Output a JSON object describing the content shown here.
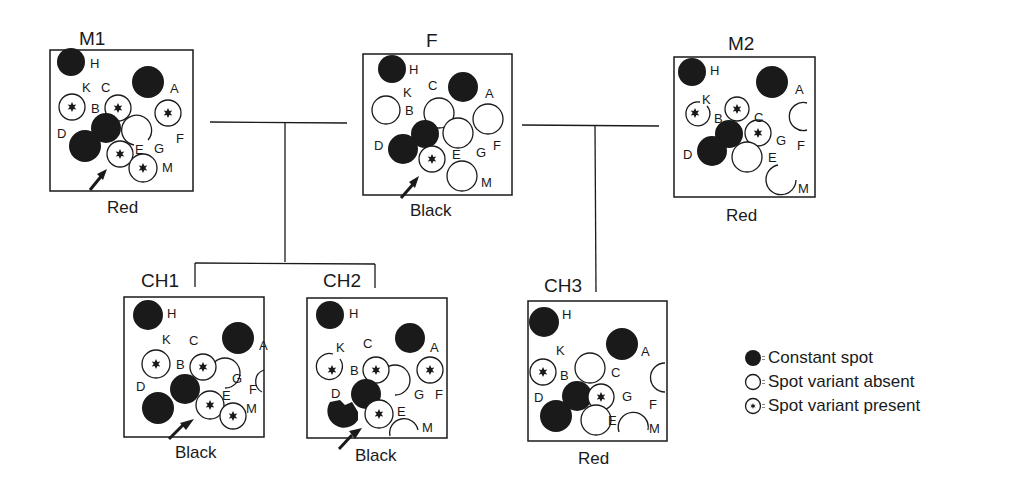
{
  "individuals": [
    {
      "id": "M1",
      "title": "M1",
      "phenotype": "Red",
      "arrow": true,
      "spots": {
        "H": "constant",
        "A": "constant",
        "D": "constant",
        "B": "constant",
        "K": "present",
        "C": "present",
        "F": "present",
        "E": "present",
        "M": "present",
        "G": "absent"
      }
    },
    {
      "id": "F",
      "title": "F",
      "phenotype": "Black",
      "arrow": true,
      "spots": {
        "H": "constant",
        "A": "constant",
        "D": "constant",
        "B": "constant",
        "K": "absent",
        "C": "absent",
        "F": "absent",
        "G": "absent",
        "M": "absent",
        "E": "present"
      }
    },
    {
      "id": "M2",
      "title": "M2",
      "phenotype": "Red",
      "arrow": false,
      "spots": {
        "H": "constant",
        "A": "constant",
        "D": "constant",
        "B": "constant",
        "K": "present",
        "C": "present",
        "G": "present",
        "F": "absent",
        "E": "absent",
        "M": "absent"
      }
    },
    {
      "id": "CH1",
      "title": "CH1",
      "phenotype": "Black",
      "arrow": true,
      "spots": {
        "H": "constant",
        "A": "constant",
        "D": "constant",
        "B": "constant",
        "K": "present",
        "C": "present",
        "E": "present",
        "M": "present",
        "F": "absent",
        "G": "absent"
      }
    },
    {
      "id": "CH2",
      "title": "CH2",
      "phenotype": "Black",
      "arrow": true,
      "spots": {
        "H": "constant",
        "A": "constant",
        "D": "constant",
        "B": "constant",
        "K": "present",
        "C": "present",
        "F": "present",
        "E": "present",
        "G": "absent",
        "M": "absent"
      }
    },
    {
      "id": "CH3",
      "title": "CH3",
      "phenotype": "Red",
      "arrow": false,
      "spots": {
        "H": "constant",
        "A": "constant",
        "D": "constant",
        "B": "constant",
        "K": "present",
        "G": "present",
        "C": "absent",
        "F": "absent",
        "E": "absent",
        "M": "absent"
      }
    }
  ],
  "crosses": [
    {
      "parents": [
        "M1",
        "F"
      ],
      "offspring": [
        "CH1",
        "CH2"
      ]
    },
    {
      "parents": [
        "F",
        "M2"
      ],
      "offspring": [
        "CH3"
      ]
    }
  ],
  "legend": [
    {
      "symbol": "filled-circle",
      "label": "= Constant spot",
      "text": "Constant spot"
    },
    {
      "symbol": "open-circle",
      "label": "= Spot variant absent",
      "text": "Spot variant absent"
    },
    {
      "symbol": "star-circle",
      "label": "= Spot variant present",
      "text": "Spot variant present"
    }
  ],
  "colors": {
    "ink": "#1a1a1a",
    "background": "#ffffff"
  }
}
